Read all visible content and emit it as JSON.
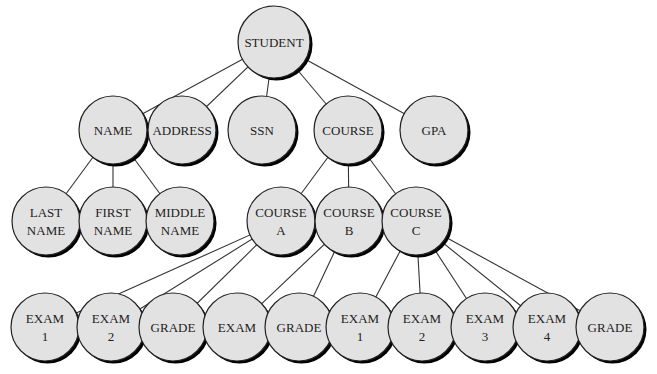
{
  "diagram": {
    "colors": {
      "node_fill": "#e2e2e2",
      "node_stroke": "#222222",
      "shadow": "#000000",
      "edge": "#333333",
      "background": "#ffffff"
    },
    "radius": 34,
    "nodes": [
      {
        "id": "student",
        "lines": [
          "STUDENT"
        ],
        "x": 274,
        "y": 42,
        "r": 36
      },
      {
        "id": "name",
        "lines": [
          "NAME"
        ],
        "x": 113,
        "y": 130
      },
      {
        "id": "address",
        "lines": [
          "ADDRESS"
        ],
        "x": 182,
        "y": 130
      },
      {
        "id": "ssn",
        "lines": [
          "SSN"
        ],
        "x": 262,
        "y": 130
      },
      {
        "id": "course",
        "lines": [
          "COURSE"
        ],
        "x": 348,
        "y": 130
      },
      {
        "id": "gpa",
        "lines": [
          "GPA"
        ],
        "x": 434,
        "y": 130
      },
      {
        "id": "last-name",
        "lines": [
          "LAST",
          "NAME"
        ],
        "x": 46,
        "y": 221
      },
      {
        "id": "first-name",
        "lines": [
          "FIRST",
          "NAME"
        ],
        "x": 113,
        "y": 221
      },
      {
        "id": "middle-name",
        "lines": [
          "MIDDLE",
          "NAME"
        ],
        "x": 180,
        "y": 221
      },
      {
        "id": "course-a",
        "lines": [
          "COURSE",
          "A"
        ],
        "x": 281,
        "y": 221
      },
      {
        "id": "course-b",
        "lines": [
          "COURSE",
          "B"
        ],
        "x": 349,
        "y": 221
      },
      {
        "id": "course-c",
        "lines": [
          "COURSE",
          "C"
        ],
        "x": 416,
        "y": 221
      },
      {
        "id": "a-exam-1",
        "lines": [
          "EXAM",
          "1"
        ],
        "x": 45,
        "y": 327
      },
      {
        "id": "a-exam-2",
        "lines": [
          "EXAM",
          "2"
        ],
        "x": 111,
        "y": 327
      },
      {
        "id": "a-grade",
        "lines": [
          "GRADE"
        ],
        "x": 173,
        "y": 327
      },
      {
        "id": "b-exam",
        "lines": [
          "EXAM"
        ],
        "x": 237,
        "y": 327
      },
      {
        "id": "b-grade",
        "lines": [
          "GRADE"
        ],
        "x": 299,
        "y": 327
      },
      {
        "id": "c-exam-1",
        "lines": [
          "EXAM",
          "1"
        ],
        "x": 360,
        "y": 327
      },
      {
        "id": "c-exam-2",
        "lines": [
          "EXAM",
          "2"
        ],
        "x": 422,
        "y": 327
      },
      {
        "id": "c-exam-3",
        "lines": [
          "EXAM",
          "3"
        ],
        "x": 485,
        "y": 327
      },
      {
        "id": "c-exam-4",
        "lines": [
          "EXAM",
          "4"
        ],
        "x": 547,
        "y": 327
      },
      {
        "id": "c-grade",
        "lines": [
          "GRADE"
        ],
        "x": 610,
        "y": 327
      }
    ],
    "edges": [
      [
        "student",
        "name"
      ],
      [
        "student",
        "address"
      ],
      [
        "student",
        "ssn"
      ],
      [
        "student",
        "course"
      ],
      [
        "student",
        "gpa"
      ],
      [
        "name",
        "last-name"
      ],
      [
        "name",
        "first-name"
      ],
      [
        "name",
        "middle-name"
      ],
      [
        "course",
        "course-a"
      ],
      [
        "course",
        "course-b"
      ],
      [
        "course",
        "course-c"
      ],
      [
        "course-a",
        "a-exam-1"
      ],
      [
        "course-a",
        "a-exam-2"
      ],
      [
        "course-a",
        "a-grade"
      ],
      [
        "course-b",
        "b-exam"
      ],
      [
        "course-b",
        "b-grade"
      ],
      [
        "course-c",
        "c-exam-1"
      ],
      [
        "course-c",
        "c-exam-2"
      ],
      [
        "course-c",
        "c-exam-3"
      ],
      [
        "course-c",
        "c-exam-4"
      ],
      [
        "course-c",
        "c-grade"
      ]
    ]
  }
}
